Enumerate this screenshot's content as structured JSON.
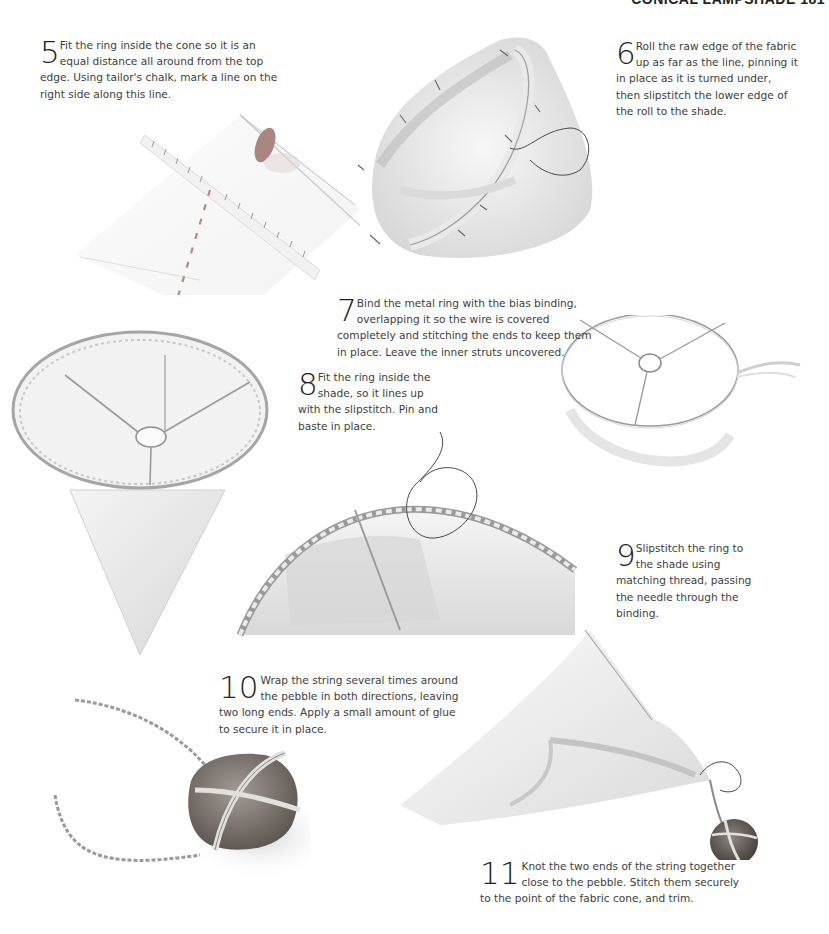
{
  "page": {
    "running_head": "CONICAL LAMPSHADE 181"
  },
  "steps": [
    {
      "number": "5",
      "text": "Fit the ring inside the cone so it is an equal distance all around from the top edge. Using tailor's chalk, mark a line on the right side along this line."
    },
    {
      "number": "6",
      "text": "Roll the raw edge of the fabric up as far as the line, pinning it in place as it is turned under, then slipstitch the lower edge of the roll to the shade."
    },
    {
      "number": "7",
      "text": "Bind the metal ring with the bias binding, overlapping it so the wire is covered completely and stitching the ends to keep them in place. Leave the inner struts uncovered."
    },
    {
      "number": "8",
      "text": "Fit the ring inside the shade, so it lines up with the slipstitch. Pin and baste in place."
    },
    {
      "number": "9",
      "text": "Slipstitch the ring to the shade using matching thread, passing the needle through the binding."
    },
    {
      "number": "10",
      "text": "Wrap the string several times around the pebble in both directions, leaving two long ends. Apply a small amount of glue to secure it in place."
    },
    {
      "number": "11",
      "text": "Knot the two ends of the string together close to the pebble. Stitch them securely to the point of the fabric cone, and trim."
    }
  ],
  "illustrations": [
    {
      "id": "marking-fabric-with-chalk",
      "depicts": "fabric cone edge with ruler and tailor's chalk, dashed chalk line"
    },
    {
      "id": "rolled-pinned-edge",
      "depicts": "fabric cone with rolled edge pinned and needle with thread"
    },
    {
      "id": "bound-ring-frame",
      "depicts": "lampshade ring with three struts, bias binding trailing"
    },
    {
      "id": "ring-in-cone",
      "depicts": "bound ring fitted inside fabric cone"
    },
    {
      "id": "slipstitching-ring",
      "depicts": "close-up of ring being slipstitched to shade with threaded needle"
    },
    {
      "id": "pebble-wrapped-in-string",
      "depicts": "pebble wrapped with string, two long ends"
    },
    {
      "id": "pebble-attached-to-cone",
      "depicts": "pebble knotted to the point of the fabric cone"
    }
  ],
  "colors": {
    "paper": "#ffffff",
    "text": "#3d3d3d",
    "pencil_dark": "#6a6a6a",
    "pencil_light": "#bdbdbd",
    "chalk": "#b06a6a",
    "pebble": "#6e6660",
    "thread": "#4a4a4a"
  }
}
